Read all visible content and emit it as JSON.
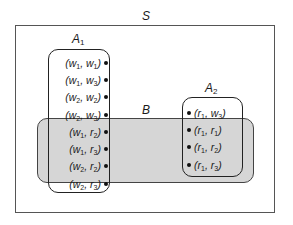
{
  "sets": {
    "S": {
      "name": "S",
      "sub": ""
    },
    "A1": {
      "name": "A",
      "sub": "1"
    },
    "A2": {
      "name": "A",
      "sub": "2"
    },
    "B": {
      "name": "B",
      "sub": ""
    }
  },
  "elements": {
    "A1": [
      {
        "a": "w",
        "a_sub": "1",
        "b": "w",
        "b_sub": "1"
      },
      {
        "a": "w",
        "a_sub": "1",
        "b": "w",
        "b_sub": "3"
      },
      {
        "a": "w",
        "a_sub": "2",
        "b": "w",
        "b_sub": "2"
      },
      {
        "a": "w",
        "a_sub": "2",
        "b": "w",
        "b_sub": "3"
      },
      {
        "a": "w",
        "a_sub": "1",
        "b": "r",
        "b_sub": "2"
      },
      {
        "a": "w",
        "a_sub": "1",
        "b": "r",
        "b_sub": "3"
      },
      {
        "a": "w",
        "a_sub": "2",
        "b": "r",
        "b_sub": "2"
      },
      {
        "a": "w",
        "a_sub": "2",
        "b": "r",
        "b_sub": "3"
      }
    ],
    "A2": [
      {
        "a": "r",
        "a_sub": "1",
        "b": "w",
        "b_sub": "3"
      },
      {
        "a": "r",
        "a_sub": "1",
        "b": "r",
        "b_sub": "1"
      },
      {
        "a": "r",
        "a_sub": "1",
        "b": "r",
        "b_sub": "2"
      },
      {
        "a": "r",
        "a_sub": "1",
        "b": "r",
        "b_sub": "3"
      }
    ]
  },
  "colors": {
    "B_fill": "#d6d6d6",
    "outline": "#222222"
  }
}
